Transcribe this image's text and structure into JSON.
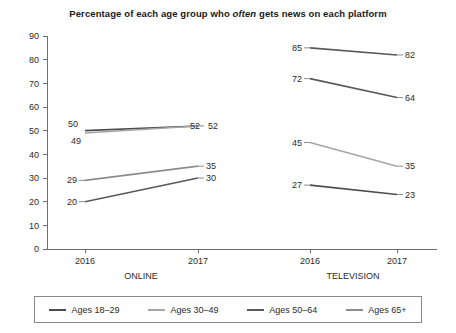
{
  "chart_data": {
    "type": "line",
    "title": "Percentage of each age group who often gets news on each platform",
    "title_parts": {
      "before": "Percentage of each age group who ",
      "emphasis": "often",
      "after": " gets news on each platform"
    },
    "xlabel": "",
    "ylabel": "",
    "ylim": [
      0,
      90
    ],
    "y_ticks": [
      0,
      10,
      20,
      30,
      40,
      50,
      60,
      70,
      80,
      90
    ],
    "grid": false,
    "legend_position": "bottom",
    "x": [
      "2016",
      "2017"
    ],
    "panels": [
      {
        "name": "ONLINE",
        "label": "ONLINE",
        "x_tick_labels": [
          "2016",
          "2017"
        ],
        "series": [
          {
            "name": "Ages 18–29",
            "values": [
              50,
              52
            ],
            "color": "#4d4d4d"
          },
          {
            "name": "Ages 30–49",
            "values": [
              49,
              52
            ],
            "color": "#a6a6a6"
          },
          {
            "name": "Ages 50–64",
            "values": [
              29,
              35
            ],
            "color": "#8c8c8c"
          },
          {
            "name": "Ages 65+",
            "values": [
              20,
              30
            ],
            "color": "#595959"
          }
        ]
      },
      {
        "name": "TELEVISION",
        "label": "TELEVISION",
        "x_tick_labels": [
          "2016",
          "2017"
        ],
        "series": [
          {
            "name": "Ages 18–29",
            "values": [
              27,
              23
            ],
            "color": "#4d4d4d"
          },
          {
            "name": "Ages 30–49",
            "values": [
              45,
              35
            ],
            "color": "#a6a6a6"
          },
          {
            "name": "Ages 50–64",
            "values": [
              72,
              64
            ],
            "color": "#595959"
          },
          {
            "name": "Ages 65+",
            "values": [
              85,
              82
            ],
            "color": "#595959"
          }
        ]
      }
    ],
    "legend": [
      {
        "label": "Ages 18–29",
        "color": "#4d4d4d"
      },
      {
        "label": "Ages 30–49",
        "color": "#a6a6a6"
      },
      {
        "label": "Ages 50–64",
        "color": "#595959"
      },
      {
        "label": "Ages 65+",
        "color": "#8c8c8c"
      }
    ],
    "data_labels": {
      "online": [
        {
          "series": "Ages 18–29",
          "left": "50",
          "right": "52"
        },
        {
          "series": "Ages 30–49",
          "left": "49",
          "right": "52"
        },
        {
          "series": "Ages 50–64",
          "left": "29",
          "right": "35"
        },
        {
          "series": "Ages 65+",
          "left": "20",
          "right": "30"
        }
      ],
      "television": [
        {
          "series": "Ages 65+",
          "left": "85",
          "right": "82"
        },
        {
          "series": "Ages 50–64",
          "left": "72",
          "right": "64"
        },
        {
          "series": "Ages 30–49",
          "left": "45",
          "right": "35"
        },
        {
          "series": "Ages 18–29",
          "left": "27",
          "right": "23"
        }
      ]
    }
  },
  "layout": {
    "plot": {
      "x0": 47,
      "x1": 437,
      "y_top": 36,
      "y_bottom": 249
    },
    "panel_ticks": {
      "online": [
        85,
        198
      ],
      "television": [
        310,
        397
      ]
    },
    "panel_label_x": {
      "online": 141,
      "television": 353
    }
  }
}
